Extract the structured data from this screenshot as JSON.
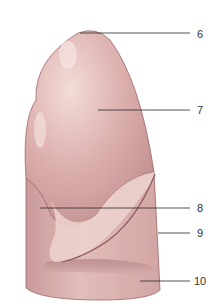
{
  "figure": {
    "colors": {
      "organ_fill": "#d9aaa8",
      "organ_light": "#efd6d3",
      "organ_shadow": "#b07c7d",
      "outline": "#9a6468",
      "leader_line": "#2a2a2a",
      "label_text": "#333333"
    },
    "labels": [
      {
        "id": "6",
        "text": "6",
        "x": 197,
        "y": 29
      },
      {
        "id": "7",
        "text": "7",
        "x": 197,
        "y": 105
      },
      {
        "id": "8",
        "text": "8",
        "x": 197,
        "y": 203
      },
      {
        "id": "9",
        "text": "9",
        "x": 197,
        "y": 228
      },
      {
        "id": "10",
        "text": "10",
        "x": 194,
        "y": 276
      }
    ]
  }
}
